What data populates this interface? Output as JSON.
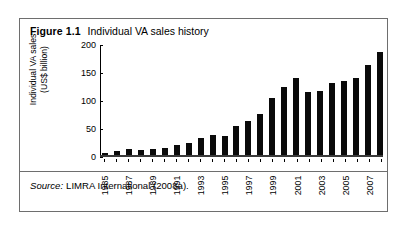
{
  "figure": {
    "label": "Figure 1.1",
    "title": "Individual VA sales history",
    "source_word": "Source:",
    "source_text": "LIMRA International (2008a)."
  },
  "chart_data": {
    "type": "bar",
    "title": "Individual VA sales history",
    "xlabel": "",
    "ylabel": "Individual VA sales (US$ billion)",
    "ylabel_line1": "Individual VA sales",
    "ylabel_line2": "(US$ billion)",
    "ylim": [
      0,
      200
    ],
    "yticks": [
      0,
      50,
      100,
      150,
      200
    ],
    "ytick_labels": [
      "0",
      "50",
      "100",
      "150",
      "200"
    ],
    "grid": false,
    "legend": false,
    "bar_color": "#0a0a0a",
    "categories": [
      "1985",
      "1986",
      "1987",
      "1988",
      "1989",
      "1990",
      "1991",
      "1992",
      "1993",
      "1994",
      "1995",
      "1996",
      "1997",
      "1998",
      "1999",
      "2000",
      "2001",
      "2002",
      "2003",
      "2004",
      "2005",
      "2006",
      "2007",
      "2008"
    ],
    "xtick_labels_shown": [
      "1985",
      "",
      "1987",
      "",
      "1989",
      "",
      "1991",
      "",
      "1993",
      "",
      "1995",
      "",
      "1997",
      "",
      "1999",
      "",
      "2001",
      "",
      "2003",
      "",
      "2005",
      "",
      "2007",
      ""
    ],
    "values": [
      4,
      8,
      10,
      9,
      10,
      12,
      17,
      21,
      31,
      35,
      34,
      51,
      61,
      73,
      101,
      122,
      137,
      112,
      115,
      129,
      133,
      137,
      160,
      184
    ]
  }
}
